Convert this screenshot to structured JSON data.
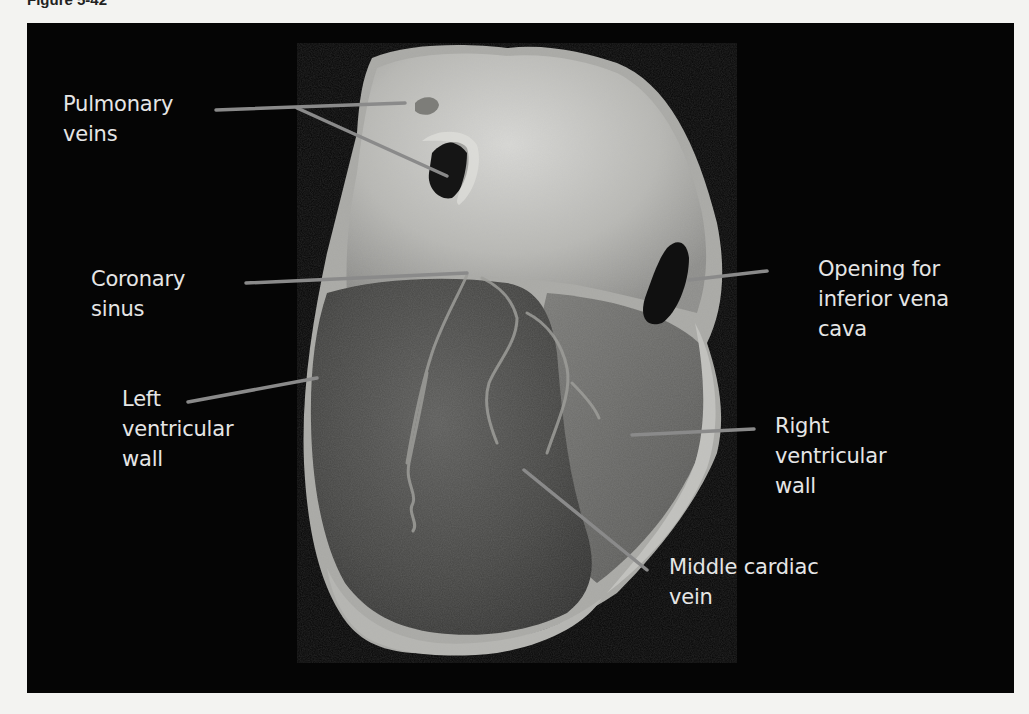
{
  "figure": {
    "caption": "Figure 5-42"
  },
  "labels": {
    "pulmonary_veins": "Pulmonary\nveins",
    "coronary_sinus": "Coronary\nsinus",
    "left_ventricular_wall": "Left\nventricular\nwall",
    "opening_ivc": "Opening for\ninferior vena\ncava",
    "right_ventricular_wall": "Right\nventricular\nwall",
    "middle_cardiac_vein": "Middle cardiac\nvein"
  },
  "colors": {
    "background": "#050505",
    "label_text": "#e6e6e6",
    "leader_line": "#8a8a8a",
    "page": "#f3f3f1"
  }
}
